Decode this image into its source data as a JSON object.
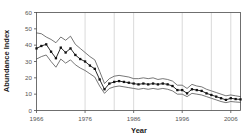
{
  "chart_data": {
    "type": "line",
    "title": "",
    "xlabel": "Year",
    "ylabel": "Abundance Index",
    "xlim": [
      1966,
      2008
    ],
    "ylim": [
      0,
      60
    ],
    "grid": "vertical gridlines at decade ticks",
    "legend": "none",
    "xticks": [
      1966,
      1976,
      1986,
      1996,
      2006
    ],
    "xtick_labels": [
      "1966",
      "1976",
      "1986",
      "1996",
      "2006"
    ],
    "yticks": [
      0,
      10,
      20,
      30,
      40,
      50,
      60
    ],
    "ytick_labels": [
      "0",
      "10",
      "20",
      "30",
      "40",
      "50",
      "60"
    ],
    "x": [
      1966,
      1967,
      1968,
      1969,
      1970,
      1971,
      1972,
      1973,
      1974,
      1975,
      1976,
      1977,
      1978,
      1979,
      1980,
      1981,
      1982,
      1983,
      1984,
      1985,
      1986,
      1987,
      1988,
      1989,
      1990,
      1991,
      1992,
      1993,
      1994,
      1995,
      1996,
      1997,
      1998,
      1999,
      2000,
      2001,
      2002,
      2003,
      2004,
      2005,
      2006,
      2007,
      2008
    ],
    "series": [
      {
        "name": "Upper confidence limit",
        "marker": "none",
        "values": [
          47.5,
          47.0,
          45.0,
          43.5,
          41.5,
          45.0,
          43.0,
          45.5,
          40.5,
          38.0,
          35.5,
          33.0,
          31.0,
          24.0,
          16.5,
          19.5,
          21.0,
          21.5,
          21.0,
          20.5,
          19.5,
          19.5,
          20.0,
          19.5,
          20.0,
          19.0,
          19.5,
          19.0,
          18.0,
          15.5,
          15.5,
          13.5,
          16.0,
          15.0,
          14.5,
          13.0,
          12.0,
          11.0,
          10.0,
          9.0,
          9.5,
          9.0,
          8.5
        ]
      },
      {
        "name": "Abundance index (mean)",
        "marker": "filled-square",
        "values": [
          38.0,
          39.5,
          40.5,
          36.0,
          32.0,
          38.5,
          35.5,
          38.0,
          34.0,
          31.5,
          30.0,
          27.5,
          25.5,
          19.0,
          13.0,
          16.5,
          17.5,
          18.0,
          17.5,
          17.0,
          16.5,
          16.0,
          16.5,
          16.0,
          16.5,
          16.0,
          16.5,
          16.0,
          15.0,
          12.5,
          12.5,
          10.5,
          13.0,
          12.5,
          12.0,
          10.5,
          9.5,
          8.5,
          7.5,
          6.5,
          7.5,
          7.0,
          6.8
        ]
      },
      {
        "name": "Lower confidence limit",
        "marker": "none",
        "values": [
          31.5,
          33.0,
          34.0,
          30.0,
          26.5,
          31.5,
          29.0,
          31.0,
          28.0,
          26.0,
          24.5,
          22.5,
          20.5,
          15.0,
          10.5,
          13.5,
          14.5,
          15.0,
          14.5,
          14.0,
          13.5,
          13.0,
          13.5,
          13.0,
          13.5,
          13.0,
          13.5,
          13.0,
          12.0,
          10.0,
          10.0,
          8.5,
          10.5,
          10.0,
          9.5,
          8.5,
          7.5,
          6.5,
          5.5,
          4.8,
          5.5,
          5.2,
          5.0
        ]
      }
    ]
  },
  "colors": {
    "mean_line": "#111111",
    "ci_line": "#4a4a4a",
    "gridline": "#c9c9c9",
    "axis": "#4d4d4d",
    "background": "#ffffff"
  }
}
